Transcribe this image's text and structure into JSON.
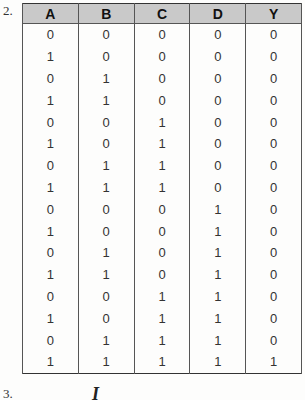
{
  "items": {
    "first_number": "2.",
    "second_number": "3.",
    "second_item_partial_glyph": "I"
  },
  "truth_table": {
    "headers": [
      "A",
      "B",
      "C",
      "D",
      "Y"
    ],
    "rows": [
      [
        "0",
        "0",
        "0",
        "0",
        "0"
      ],
      [
        "1",
        "0",
        "0",
        "0",
        "0"
      ],
      [
        "0",
        "1",
        "0",
        "0",
        "0"
      ],
      [
        "1",
        "1",
        "0",
        "0",
        "0"
      ],
      [
        "0",
        "0",
        "1",
        "0",
        "0"
      ],
      [
        "1",
        "0",
        "1",
        "0",
        "0"
      ],
      [
        "0",
        "1",
        "1",
        "0",
        "0"
      ],
      [
        "1",
        "1",
        "1",
        "0",
        "0"
      ],
      [
        "0",
        "0",
        "0",
        "1",
        "0"
      ],
      [
        "1",
        "0",
        "0",
        "1",
        "0"
      ],
      [
        "0",
        "1",
        "0",
        "1",
        "0"
      ],
      [
        "1",
        "1",
        "0",
        "1",
        "0"
      ],
      [
        "0",
        "0",
        "1",
        "1",
        "0"
      ],
      [
        "1",
        "0",
        "1",
        "1",
        "0"
      ],
      [
        "0",
        "1",
        "1",
        "1",
        "0"
      ],
      [
        "1",
        "1",
        "1",
        "1",
        "1"
      ]
    ]
  },
  "colors": {
    "header_bg": "#c9c9c9",
    "border": "#333333",
    "page_bg": "#fdfdfc"
  }
}
